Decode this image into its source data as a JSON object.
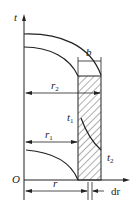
{
  "labels": {
    "t_axis": "t",
    "origin": "O",
    "b": "b",
    "r2": "r",
    "r2_sub": "2",
    "r1": "r",
    "r1_sub": "1",
    "t1": "t",
    "t1_sub": "1",
    "t2": "t",
    "t2_sub": "2",
    "r": "r",
    "dr": "dr"
  },
  "colors": {
    "line": "#222222",
    "background": "#ffffff"
  }
}
